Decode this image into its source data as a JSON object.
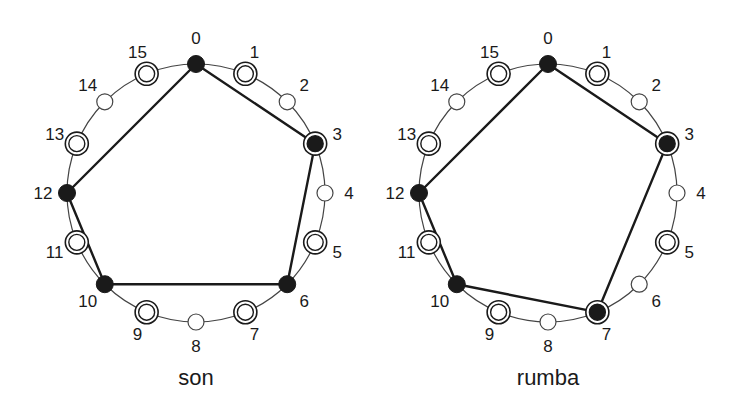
{
  "figure": {
    "colors": {
      "ink": "#1a1a1a",
      "background": "#ffffff",
      "circle": "#444444"
    },
    "pulses": 16,
    "diagrams": [
      {
        "id": "son",
        "caption": "son",
        "center": [
          196,
          193
        ],
        "radius": 129,
        "onsets": [
          0,
          3,
          6,
          10,
          12
        ],
        "double_ring": [
          1,
          3,
          5,
          7,
          9,
          11,
          13,
          15
        ],
        "labels": [
          "0",
          "1",
          "2",
          "3",
          "4",
          "5",
          "6",
          "7",
          "8",
          "9",
          "10",
          "11",
          "12",
          "13",
          "14",
          "15"
        ]
      },
      {
        "id": "rumba",
        "caption": "rumba",
        "center": [
          548,
          193
        ],
        "radius": 129,
        "onsets": [
          0,
          3,
          7,
          10,
          12
        ],
        "double_ring": [
          1,
          3,
          5,
          7,
          9,
          11,
          13,
          15
        ],
        "labels": [
          "0",
          "1",
          "2",
          "3",
          "4",
          "5",
          "6",
          "7",
          "8",
          "9",
          "10",
          "11",
          "12",
          "13",
          "14",
          "15"
        ]
      }
    ]
  }
}
